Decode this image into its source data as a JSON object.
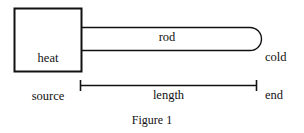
{
  "figure": {
    "caption": "Figure 1",
    "background_color": "#ffffff",
    "stroke_color": "#111111",
    "text_color": "#111111"
  },
  "diagram": {
    "type": "schematic",
    "heat_source": {
      "label_line_1": "heat",
      "label_line_2": "source",
      "shape": "rectangle",
      "stroke_width_px": 2
    },
    "rod": {
      "label": "rod",
      "shape": "rounded-right-end-bar",
      "stroke_width_px": 1
    },
    "cold_end": {
      "label_line_1": "cold",
      "label_line_2": "end"
    },
    "dimension": {
      "label": "length",
      "style": "line-with-end-ticks"
    }
  }
}
